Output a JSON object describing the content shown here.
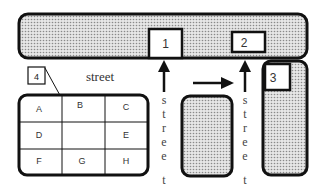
{
  "diagram": {
    "type": "street map / site plan",
    "colors": {
      "stroke": "#111111",
      "building_fill_dots": "#8a8a8a",
      "building_fill_bg": "#e6e6e6",
      "background": "#ffffff"
    },
    "labels": {
      "horizontal_street": "street",
      "vertical_street_left": [
        "s",
        "t",
        "r",
        "e",
        "e",
        "t"
      ],
      "vertical_street_right": [
        "s",
        "t",
        "r",
        "e",
        "e",
        "t"
      ]
    },
    "markers": [
      {
        "id": "1",
        "label": "1"
      },
      {
        "id": "2",
        "label": "2"
      },
      {
        "id": "3",
        "label": "3"
      },
      {
        "id": "4",
        "label": "4"
      }
    ],
    "grid": {
      "cells": [
        {
          "label": "A"
        },
        {
          "label": "B"
        },
        {
          "label": "C"
        },
        {
          "label": "D"
        },
        {
          "label": ""
        },
        {
          "label": "E"
        },
        {
          "label": "F"
        },
        {
          "label": "G"
        },
        {
          "label": "H"
        }
      ]
    },
    "arrows": [
      {
        "name": "up-arrow-to-1",
        "direction": "up"
      },
      {
        "name": "right-arrow",
        "direction": "right"
      },
      {
        "name": "up-arrow-to-2",
        "direction": "up"
      }
    ],
    "buildings": [
      {
        "name": "top-block"
      },
      {
        "name": "middle-block"
      },
      {
        "name": "right-block"
      }
    ]
  }
}
